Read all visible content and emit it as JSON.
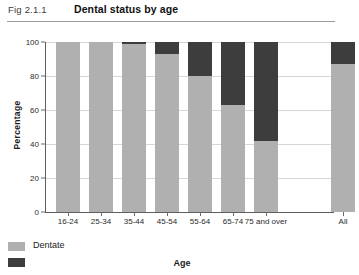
{
  "figure": {
    "number": "Fig 2.1.1",
    "title": "Dental status by age"
  },
  "colors": {
    "dentate": "#b0b0b0",
    "edentate": "#3d3d3d",
    "axis": "#5d5d5d",
    "grid": "#d7d7d7"
  },
  "legend": {
    "items": [
      {
        "label": "Dentate",
        "color": "#b0b0b0"
      },
      {
        "label": "",
        "color": "#3d3d3d"
      }
    ]
  },
  "chart_data": {
    "type": "bar",
    "title": "Dental status by age",
    "xlabel": "Age",
    "ylabel": "Percentage",
    "ylim": [
      0,
      100
    ],
    "yticks": [
      0,
      20,
      40,
      60,
      80,
      100
    ],
    "grid": true,
    "stacked": true,
    "legend_position": "bottom-left",
    "categories": [
      "16-24",
      "25-34",
      "35-44",
      "45-54",
      "55-64",
      "65-74",
      "75 and over",
      "All"
    ],
    "series": [
      {
        "name": "Dentate",
        "color": "#b0b0b0",
        "values": [
          100,
          100,
          99,
          93,
          80,
          63,
          42,
          87
        ]
      },
      {
        "name": "Edentate",
        "color": "#3d3d3d",
        "values": [
          0,
          0,
          1,
          7,
          20,
          37,
          58,
          13
        ]
      }
    ]
  }
}
